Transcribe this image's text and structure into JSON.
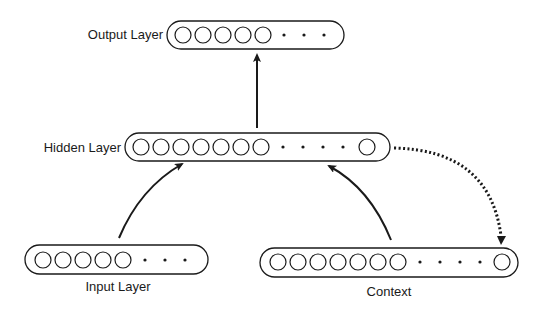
{
  "diagram": {
    "type": "simple recurrent network (Elman)",
    "layers": {
      "output": {
        "label": "Output Layer",
        "units_shown": 5,
        "ellipsis_dots": 3,
        "trailing_units": 0
      },
      "hidden": {
        "label": "Hidden Layer",
        "units_shown": 7,
        "ellipsis_dots": 4,
        "trailing_units": 1
      },
      "input": {
        "label": "Input Layer",
        "units_shown": 5,
        "ellipsis_dots": 3,
        "trailing_units": 0
      },
      "context": {
        "label": "Context",
        "units_shown": 7,
        "ellipsis_dots": 4,
        "trailing_units": 1
      }
    },
    "connections": [
      {
        "from": "Input Layer",
        "to": "Hidden Layer",
        "style": "solid",
        "shape": "curved"
      },
      {
        "from": "Context",
        "to": "Hidden Layer",
        "style": "solid",
        "shape": "curved"
      },
      {
        "from": "Hidden Layer",
        "to": "Output Layer",
        "style": "solid",
        "shape": "straight"
      },
      {
        "from": "Hidden Layer",
        "to": "Context",
        "style": "dotted",
        "shape": "curved"
      }
    ],
    "colors": {
      "ink": "#1a1a1a",
      "background": "#ffffff"
    }
  }
}
